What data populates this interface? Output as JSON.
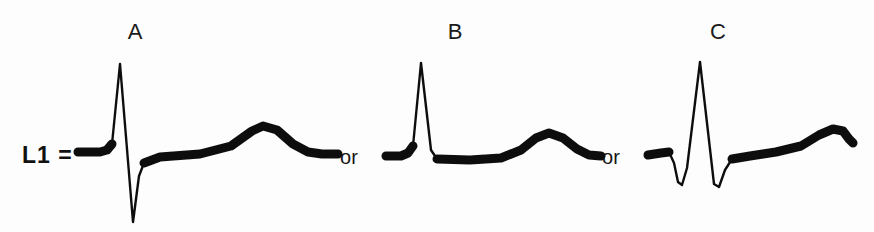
{
  "figure": {
    "background_color": "#fdfdfd",
    "ink_color": "#111111",
    "lead_label": "L1 =",
    "width": 874,
    "height": 232,
    "baseline_y": 157
  },
  "conjunctions": [
    {
      "text": "or",
      "x": 349
    },
    {
      "text": "or",
      "x": 611
    }
  ],
  "panels": [
    {
      "label": "A",
      "label_x": 135,
      "description": "RS complex with tall R wave, deep S wave and broad asymmetric T wave",
      "morphology": "RS",
      "features": {
        "q_wave": false,
        "r_wave": true,
        "s_wave": true,
        "t_wave": "broad asymmetric upright hump"
      },
      "r_peak_y": 64,
      "s_trough_y": 222,
      "t_peak_y": 122
    },
    {
      "label": "B",
      "label_x": 455,
      "description": "Tall narrow R wave rising from baseline without Q or S wave, small rounded T wave",
      "morphology": "R",
      "features": {
        "q_wave": false,
        "r_wave": true,
        "s_wave": false,
        "t_wave": "small symmetric rounded bump"
      },
      "r_peak_y": 63,
      "s_trough_y": 157,
      "t_peak_y": 128
    },
    {
      "label": "C",
      "label_x": 718,
      "description": "qRs complex with small Q wave, tall R wave, small S wave and gradually rising T wave",
      "morphology": "qRs",
      "features": {
        "q_wave": true,
        "r_wave": true,
        "s_wave": true,
        "t_wave": "slowly rising plateau ending in a hook"
      },
      "q_trough_y": 182,
      "r_peak_y": 62,
      "s_trough_y": 185,
      "t_peak_y": 130
    }
  ],
  "traces": {
    "A": "M 78 151 L 99 151 L 104 150 L 110 147 L 120 64 L 133 222 L 140 170 L 146 161 L 160 157 L 200 154 L 230 146 L 252 131 L 262 126 L 276 129 L 292 143 L 306 152 L 322 154 L 336 154",
    "B": "M 386 155 L 400 155 L 406 153 L 412 149 L 421 63 L 432 152 L 440 158 L 470 159 L 500 158 L 520 150 L 535 138 L 548 133 L 562 137 L 576 148 L 588 155 L 600 156",
    "C": "M 648 155 L 660 153 L 668 152 L 673 160 L 677 180 L 681 184 L 686 170 L 700 62 L 714 183 L 719 186 L 724 172 L 733 160 L 748 156 L 775 152 L 800 146 L 818 135 L 832 129 L 842 131 L 848 138 L 852 142"
  }
}
